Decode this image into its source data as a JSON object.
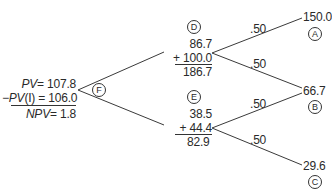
{
  "root": {
    "id": "F",
    "pv_label": "PV",
    "pv_value": "= 107.8",
    "investment_label": "−PV",
    "investment_suffix": "(I) = 106.0",
    "npv_label": "NPV",
    "npv_value": "= 1.8"
  },
  "nodes": [
    {
      "id": "D",
      "value": "86.7",
      "cash_flow": "+ 100.0",
      "total": "186.7",
      "branches": [
        {
          "probability": ".50",
          "outcome": "150.0",
          "outcome_id": "A"
        },
        {
          "probability": ".50",
          "outcome": "66.7",
          "outcome_id": "B"
        }
      ]
    },
    {
      "id": "E",
      "value": "38.5",
      "cash_flow": "+ 44.4",
      "total": "82.9",
      "branches": [
        {
          "probability": ".50",
          "outcome": "66.7",
          "outcome_id": "B"
        },
        {
          "probability": ".50",
          "outcome": "29.6",
          "outcome_id": "C"
        }
      ]
    }
  ],
  "colors": {
    "line": "#3a3a3a",
    "text": "#2a2a2a",
    "background": "#ffffff"
  }
}
